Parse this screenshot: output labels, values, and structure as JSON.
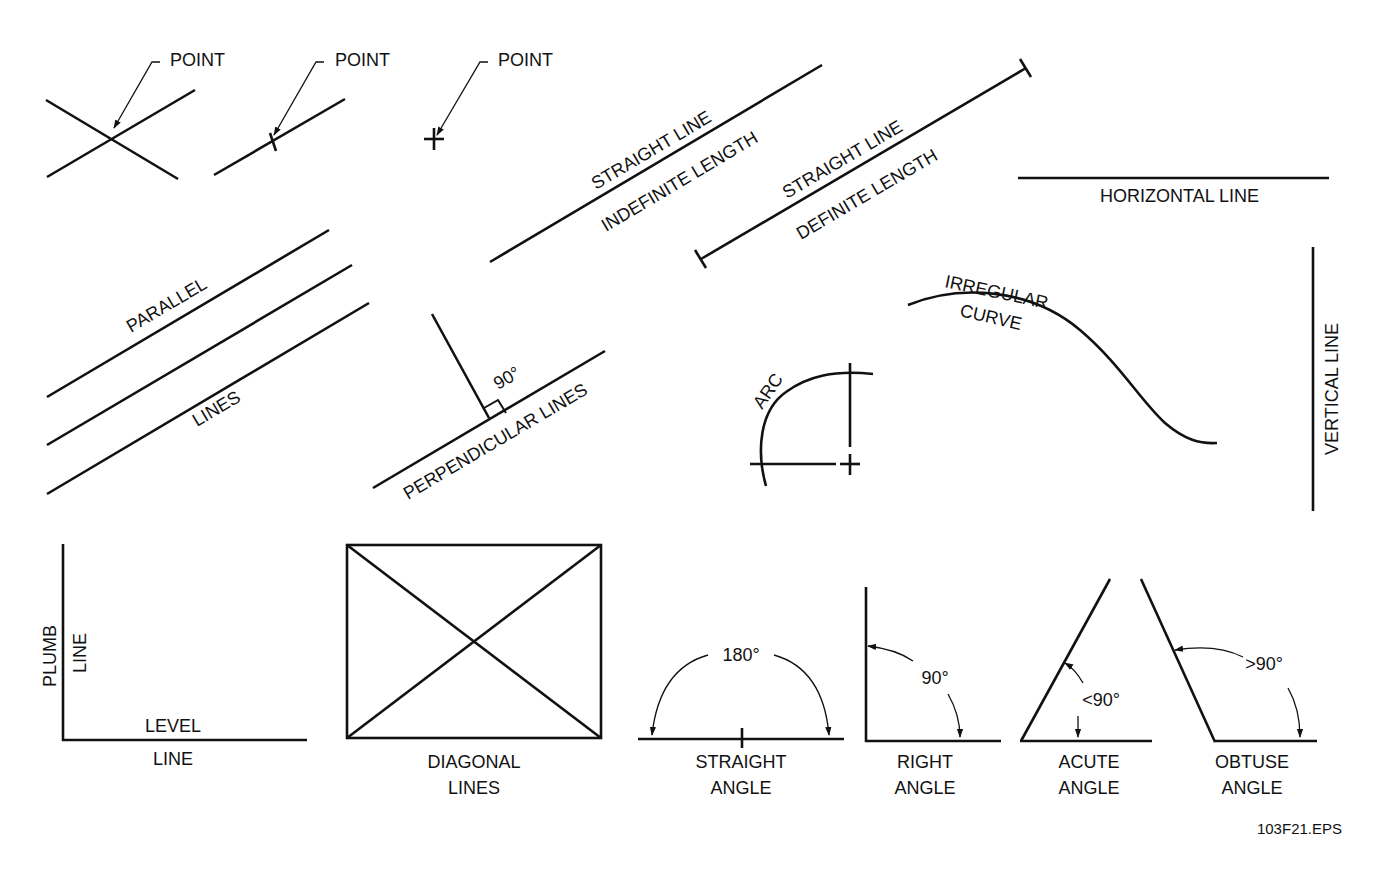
{
  "figure": {
    "id_label": "103F21.EPS",
    "stroke_color": "#111111",
    "background": "#ffffff"
  },
  "points": {
    "intersection_label": "POINT",
    "tick_on_line_label": "POINT",
    "cross_mark_label": "POINT"
  },
  "straight_lines": {
    "indefinite": {
      "line1": "STRAIGHT LINE",
      "line2": "INDEFINITE LENGTH"
    },
    "definite": {
      "line1": "STRAIGHT LINE",
      "line2": "DEFINITE LENGTH"
    }
  },
  "horizontal_line": {
    "label": "HORIZONTAL LINE"
  },
  "vertical_line": {
    "label": "VERTICAL LINE"
  },
  "parallel_lines": {
    "label_top": "PARALLEL",
    "label_bottom": "LINES"
  },
  "perpendicular_lines": {
    "angle": "90°",
    "label": "PERPENDICULAR LINES"
  },
  "arc": {
    "label": "ARC"
  },
  "irregular_curve": {
    "label_top": "IRREGULAR",
    "label_bottom": "CURVE"
  },
  "plumb_level": {
    "plumb_line1": "PLUMB",
    "plumb_line2": "LINE",
    "level_line1": "LEVEL",
    "level_line2": "LINE"
  },
  "diagonal_lines": {
    "line1": "DIAGONAL",
    "line2": "LINES"
  },
  "angles": [
    {
      "name": "straight",
      "degree": "180°",
      "line1": "STRAIGHT",
      "line2": "ANGLE"
    },
    {
      "name": "right",
      "degree": "90°",
      "line1": "RIGHT",
      "line2": "ANGLE"
    },
    {
      "name": "acute",
      "degree": "<90°",
      "line1": "ACUTE",
      "line2": "ANGLE"
    },
    {
      "name": "obtuse",
      "degree": ">90°",
      "line1": "OBTUSE",
      "line2": "ANGLE"
    }
  ]
}
